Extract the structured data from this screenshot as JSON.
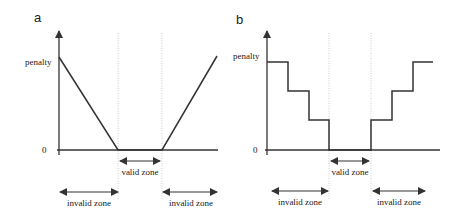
{
  "panels": [
    {
      "label": "a",
      "y_label": "penalty",
      "zero_label": "0",
      "function_type": "linear",
      "zones": {
        "valid": "valid zone",
        "invalid_left": "invalid zone",
        "invalid_right": "invalid zone"
      }
    },
    {
      "label": "b",
      "y_label": "penalty",
      "zero_label": "0",
      "function_type": "step",
      "zones": {
        "valid": "valid zone",
        "invalid_left": "invalid zone",
        "invalid_right": "invalid zone"
      }
    }
  ],
  "colors": {
    "line": "#333333",
    "guide": "#cccccc",
    "text": "#222222"
  }
}
